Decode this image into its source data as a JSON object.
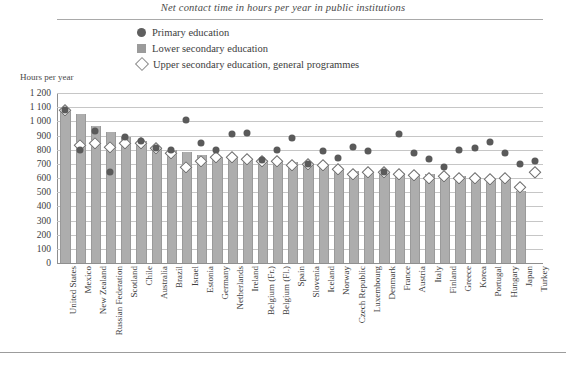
{
  "chart_data": {
    "type": "bar",
    "title": "Net contact time in hours per year in public institutions",
    "ylabel": "Hours per year",
    "xlabel": "",
    "ylim": [
      0,
      1200
    ],
    "ytick_step": 100,
    "ytick_labels": [
      "1 200",
      "1 100",
      "1 000",
      "900",
      "800",
      "700",
      "600",
      "500",
      "400",
      "300",
      "200",
      "100",
      "0"
    ],
    "grid": true,
    "legend_position": "top-center",
    "legend": [
      {
        "label": "Primary education",
        "marker": "circle",
        "color": "#5a5a5a"
      },
      {
        "label": "Lower secondary education",
        "marker": "square",
        "color": "#adadad"
      },
      {
        "label": "Upper secondary education, general programmes",
        "marker": "diamond",
        "color": "#ffffff"
      }
    ],
    "categories": [
      "United States",
      "Mexico",
      "New Zealand",
      "Russian Federation",
      "Scotland",
      "Chile",
      "Australia",
      "Brazil",
      "Israel",
      "Estonia",
      "Germany",
      "Netherlands",
      "Ireland",
      "Belgium (Fr.)",
      "Belgium (Fl.)",
      "Spain",
      "Slovenia",
      "Iceland",
      "Norway",
      "Czech Republic",
      "Luxembourg",
      "Denmark",
      "France",
      "Austria",
      "Italy",
      "Finland",
      "Greece",
      "Korea",
      "Portugal",
      "Hungary",
      "Japan",
      "Turkey"
    ],
    "series": [
      {
        "name": "Lower secondary education",
        "marker": "bar",
        "values": [
          1080,
          1050,
          965,
          925,
          890,
          860,
          815,
          800,
          785,
          760,
          750,
          750,
          735,
          725,
          720,
          710,
          700,
          690,
          665,
          650,
          645,
          640,
          635,
          630,
          630,
          620,
          615,
          610,
          600,
          600,
          510,
          null
        ]
      },
      {
        "name": "Primary education",
        "marker": "circle",
        "values": [
          1080,
          800,
          935,
          645,
          890,
          860,
          815,
          800,
          1010,
          845,
          800,
          910,
          920,
          725,
          800,
          880,
          700,
          790,
          740,
          820,
          790,
          640,
          910,
          780,
          735,
          680,
          800,
          810,
          855,
          780,
          700,
          720
        ]
      },
      {
        "name": "Upper secondary education, general programmes",
        "marker": "diamond",
        "values": [
          1080,
          835,
          850,
          820,
          850,
          845,
          815,
          780,
          675,
          720,
          745,
          750,
          735,
          720,
          720,
          690,
          700,
          690,
          665,
          625,
          640,
          640,
          625,
          620,
          600,
          615,
          600,
          600,
          590,
          600,
          540,
          640
        ]
      }
    ]
  }
}
